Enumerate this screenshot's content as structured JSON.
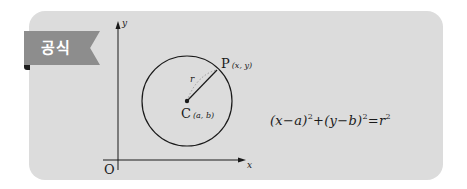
{
  "badge": {
    "label": "공식"
  },
  "diagram": {
    "axis_x_label": "x",
    "axis_y_label": "y",
    "origin_label": "O",
    "radius_label": "r",
    "point_p": {
      "name": "P",
      "coord": "(x, y)"
    },
    "center_c": {
      "name": "C",
      "coord": "(a, b)"
    }
  },
  "formula": {
    "text": "(x−a)²+(y−b)²=r²",
    "parts": {
      "lhs1": "(x−a)",
      "exp1": "2",
      "plus": "+",
      "lhs2": "(y−b)",
      "exp2": "2",
      "eq": "=",
      "rhs": "r",
      "exp3": "2"
    }
  },
  "colors": {
    "card_bg": "#dcdcdc",
    "ribbon": "#8d8d8d",
    "ribbon_fold": "#1c1c1c",
    "ink": "#1a1a1a"
  }
}
